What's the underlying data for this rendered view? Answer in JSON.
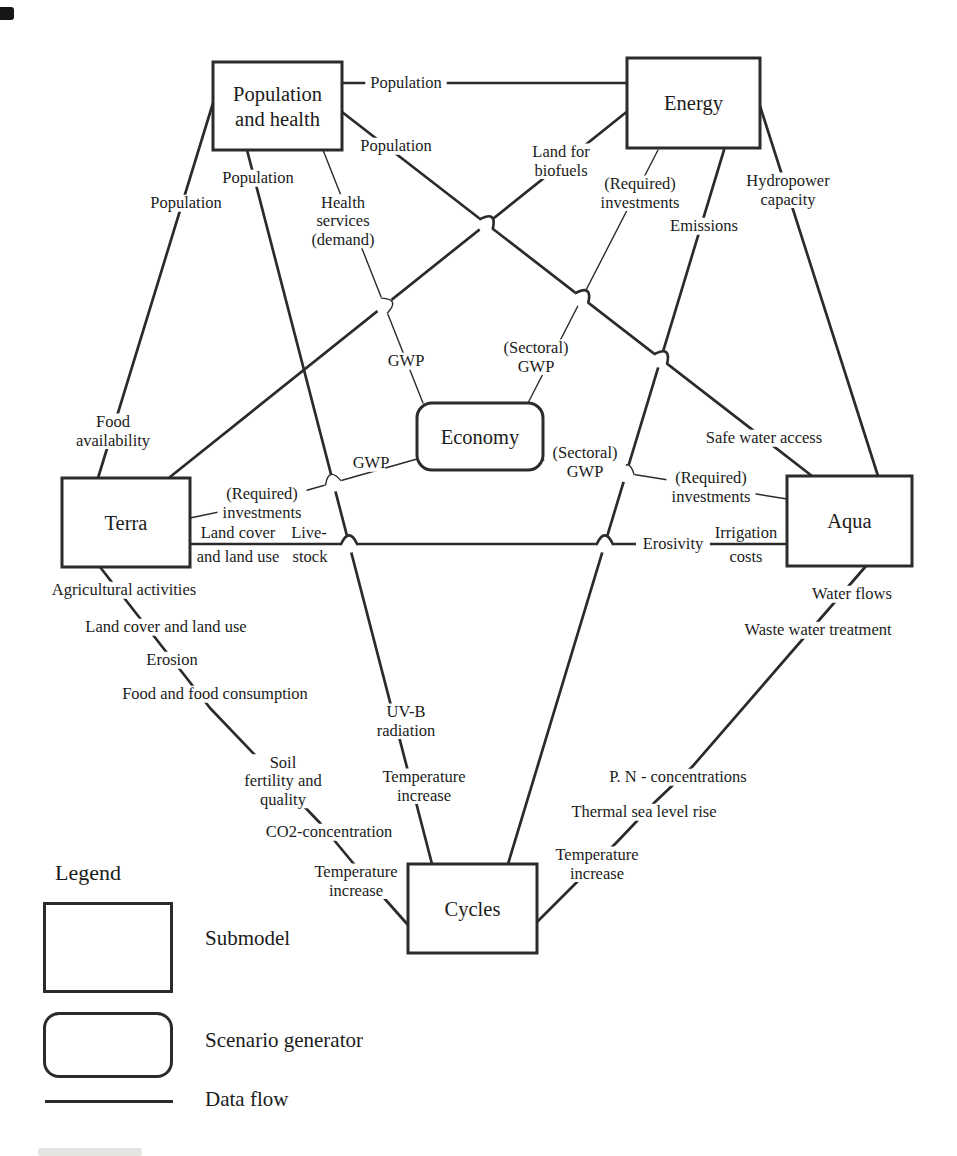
{
  "figure": {
    "colors": {
      "line": "#2b2b2b",
      "text": "#1b1b1b",
      "background": "#ffffff"
    }
  },
  "diagram": {
    "nodes": [
      {
        "id": "population",
        "label_lines": [
          "Population",
          "and health"
        ],
        "shape": "rect",
        "x": 213,
        "y": 62,
        "w": 129,
        "h": 88
      },
      {
        "id": "energy",
        "label_lines": [
          "Energy"
        ],
        "shape": "rect",
        "x": 627,
        "y": 58,
        "w": 133,
        "h": 90
      },
      {
        "id": "economy",
        "label_lines": [
          "Economy"
        ],
        "shape": "rounded",
        "x": 417,
        "y": 403,
        "w": 126,
        "h": 67
      },
      {
        "id": "terra",
        "label_lines": [
          "Terra"
        ],
        "shape": "rect",
        "x": 62,
        "y": 478,
        "w": 128,
        "h": 89
      },
      {
        "id": "aqua",
        "label_lines": [
          "Aqua"
        ],
        "shape": "rect",
        "x": 787,
        "y": 476,
        "w": 125,
        "h": 90
      },
      {
        "id": "cycles",
        "label_lines": [
          "Cycles"
        ],
        "shape": "rect",
        "x": 408,
        "y": 864,
        "w": 129,
        "h": 89
      }
    ],
    "edges": [
      {
        "id": "pop_energy",
        "from": "population",
        "to": "energy",
        "thin": false,
        "points": [
          [
            340,
            83
          ],
          [
            630,
            83
          ]
        ],
        "labels": [
          {
            "lines": [
              "Population"
            ],
            "x": 406,
            "y": 83
          }
        ]
      },
      {
        "id": "pop_terra",
        "from": "population",
        "to": "terra",
        "thin": false,
        "points": [
          [
            213,
            103
          ],
          [
            98,
            478
          ]
        ],
        "labels": [
          {
            "lines": [
              "Population"
            ],
            "x": 186,
            "y": 203
          },
          {
            "lines": [
              "Food",
              "availability"
            ],
            "x": 113,
            "y": 431
          }
        ]
      },
      {
        "id": "pop_cycles",
        "from": "population",
        "to": "cycles",
        "thin": false,
        "points": [
          [
            247,
            150
          ],
          [
            432,
            864
          ]
        ],
        "labels": [
          {
            "lines": [
              "Population"
            ],
            "x": 258,
            "y": 178
          },
          {
            "lines": [
              "UV-B",
              "radiation"
            ],
            "x": 406,
            "y": 721
          },
          {
            "lines": [
              "Temperature",
              "increase"
            ],
            "x": 424,
            "y": 786
          }
        ]
      },
      {
        "id": "pop_economy",
        "from": "population",
        "to": "economy",
        "thin": true,
        "points": [
          [
            323,
            150
          ],
          [
            423,
            403
          ]
        ],
        "hops_over": [
          "terra_energy"
        ],
        "labels": [
          {
            "lines": [
              "Health",
              "services",
              "(demand)"
            ],
            "x": 343,
            "y": 221
          },
          {
            "lines": [
              "GWP"
            ],
            "x": 406,
            "y": 361
          }
        ]
      },
      {
        "id": "pop_aqua",
        "from": "population",
        "to": "aqua",
        "thin": false,
        "points": [
          [
            342,
            112
          ],
          [
            812,
            476
          ]
        ],
        "hops_over": [
          "terra_energy",
          "energy_economy",
          "energy_cycles"
        ],
        "labels": [
          {
            "lines": [
              "Population"
            ],
            "x": 396,
            "y": 146
          },
          {
            "lines": [
              "Safe water access"
            ],
            "x": 764,
            "y": 438
          }
        ]
      },
      {
        "id": "terra_energy",
        "from": "terra",
        "to": "energy",
        "thin": false,
        "points": [
          [
            170,
            477
          ],
          [
            629,
            110
          ]
        ],
        "labels": [
          {
            "lines": [
              "Land for",
              "biofuels"
            ],
            "x": 561,
            "y": 161
          }
        ]
      },
      {
        "id": "energy_economy",
        "from": "energy",
        "to": "economy",
        "thin": true,
        "points": [
          [
            658,
            150
          ],
          [
            528,
            403
          ]
        ],
        "labels": [
          {
            "lines": [
              "(Required)",
              "investments"
            ],
            "x": 640,
            "y": 193
          },
          {
            "lines": [
              "(Sectoral)",
              "GWP"
            ],
            "x": 536,
            "y": 357
          }
        ]
      },
      {
        "id": "energy_cycles",
        "from": "energy",
        "to": "cycles",
        "thin": false,
        "points": [
          [
            724,
            150
          ],
          [
            508,
            864
          ]
        ],
        "labels": [
          {
            "lines": [
              "Emissions"
            ],
            "x": 704,
            "y": 226
          }
        ]
      },
      {
        "id": "energy_aqua",
        "from": "energy",
        "to": "aqua",
        "thin": false,
        "points": [
          [
            760,
            106
          ],
          [
            878,
            476
          ]
        ],
        "labels": [
          {
            "lines": [
              "Hydropower",
              "capacity"
            ],
            "x": 788,
            "y": 190
          }
        ]
      },
      {
        "id": "terra_economy",
        "from": "terra",
        "to": "economy",
        "thin": true,
        "points": [
          [
            190,
            518
          ],
          [
            262,
            503
          ],
          [
            417,
            459
          ]
        ],
        "hops_over": [
          "pop_cycles"
        ],
        "labels": [
          {
            "lines": [
              "(Required)",
              "investments"
            ],
            "x": 262,
            "y": 503
          },
          {
            "lines": [
              "GWP"
            ],
            "x": 371,
            "y": 463
          }
        ]
      },
      {
        "id": "terra_aqua",
        "from": "terra",
        "to": "aqua",
        "thin": false,
        "points": [
          [
            190,
            544
          ],
          [
            787,
            544
          ]
        ],
        "hops_over": [
          "pop_cycles",
          "energy_cycles"
        ],
        "labels": [
          {
            "lines": [
              "Land cover"
            ],
            "x": 238,
            "y": 533
          },
          {
            "lines": [
              "and land use"
            ],
            "x": 238,
            "y": 557
          },
          {
            "lines": [
              "Live-"
            ],
            "x": 309,
            "y": 533
          },
          {
            "lines": [
              "stock"
            ],
            "x": 310,
            "y": 557
          },
          {
            "lines": [
              "Erosivity"
            ],
            "x": 673,
            "y": 544
          },
          {
            "lines": [
              "Irrigation"
            ],
            "x": 746,
            "y": 533
          },
          {
            "lines": [
              "costs"
            ],
            "x": 746,
            "y": 557
          }
        ]
      },
      {
        "id": "terra_cycles",
        "from": "terra",
        "to": "cycles",
        "thin": false,
        "points": [
          [
            100,
            567
          ],
          [
            210,
            708
          ],
          [
            320,
            823
          ],
          [
            353,
            863
          ],
          [
            408,
            925
          ]
        ],
        "labels": [
          {
            "lines": [
              "Agricultural activities"
            ],
            "x": 124,
            "y": 590
          },
          {
            "lines": [
              "Land cover and land use"
            ],
            "x": 166,
            "y": 627
          },
          {
            "lines": [
              "Erosion"
            ],
            "x": 172,
            "y": 660
          },
          {
            "lines": [
              "Food and food consumption"
            ],
            "x": 215,
            "y": 694
          },
          {
            "lines": [
              "Soil",
              "fertility and",
              "quality"
            ],
            "x": 283,
            "y": 781
          },
          {
            "lines": [
              "CO2-concentration"
            ],
            "x": 329,
            "y": 832
          },
          {
            "lines": [
              "Temperature",
              "increase"
            ],
            "x": 356,
            "y": 881
          }
        ]
      },
      {
        "id": "aqua_economy",
        "from": "aqua",
        "to": "economy",
        "thin": true,
        "points": [
          [
            543,
            460
          ],
          [
            787,
            499
          ]
        ],
        "hops_over": [
          "energy_cycles"
        ],
        "labels": [
          {
            "lines": [
              "(Sectoral)",
              "GWP"
            ],
            "x": 585,
            "y": 462
          },
          {
            "lines": [
              "(Required)",
              "investments"
            ],
            "x": 711,
            "y": 487
          }
        ]
      },
      {
        "id": "aqua_cycles",
        "from": "aqua",
        "to": "cycles",
        "thin": false,
        "points": [
          [
            866,
            566
          ],
          [
            692,
            767
          ],
          [
            655,
            802
          ],
          [
            617,
            842
          ],
          [
            537,
            922
          ]
        ],
        "labels": [
          {
            "lines": [
              "Water flows"
            ],
            "x": 852,
            "y": 594
          },
          {
            "lines": [
              "Waste water treatment"
            ],
            "x": 818,
            "y": 630
          },
          {
            "lines": [
              "P. N - concentrations"
            ],
            "x": 678,
            "y": 777
          },
          {
            "lines": [
              "Thermal sea level rise"
            ],
            "x": 644,
            "y": 812
          },
          {
            "lines": [
              "Temperature",
              "increase"
            ],
            "x": 597,
            "y": 864
          }
        ]
      }
    ]
  },
  "legend": {
    "title": "Legend",
    "items": [
      {
        "key": "submodel",
        "label": "Submodel"
      },
      {
        "key": "scenario_generator",
        "label": "Scenario generator"
      },
      {
        "key": "data_flow",
        "label": "Data flow"
      }
    ]
  }
}
